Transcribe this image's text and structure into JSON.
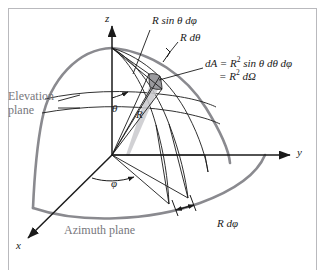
{
  "figure": {
    "type": "diagram",
    "background_color": "#ffffff",
    "frame_color": "#b9b9bd",
    "ink_color": "#1a1a1a",
    "accent_gray": "#77777c",
    "sphere_outline_color": "#8a8a8f",
    "patch_fill_color": "#9a9a9e",
    "wedge_fill_color": "#c9c9cd"
  },
  "axes": {
    "z": {
      "label": "z",
      "x": 105,
      "y": 12
    },
    "y": {
      "label": "y",
      "x": 297,
      "y": 152
    },
    "x": {
      "label": "x",
      "x": 16,
      "y": 245
    }
  },
  "angles": {
    "theta": {
      "label": "θ",
      "x": 114,
      "y": 107
    },
    "phi": {
      "label": "φ",
      "x": 112,
      "y": 182
    }
  },
  "radius": {
    "label": "R",
    "x": 137,
    "y": 114
  },
  "annotations": {
    "arc_sin": {
      "label": "R sin θ dφ",
      "x": 152,
      "y": 20
    },
    "arc_theta": {
      "label": "R dθ",
      "x": 180,
      "y": 37
    },
    "area_line1_prefix": "dA = R",
    "area_line1_exp": "2",
    "area_line1_suffix": " sin θ dθ dφ",
    "area_line2_prefix": "= R",
    "area_line2_exp": "2",
    "area_line2_suffix": " dΩ",
    "area_x": 205,
    "area_y": 62,
    "arc_phi": {
      "label": "R dφ",
      "x": 217,
      "y": 223
    }
  },
  "planes": {
    "elevation": {
      "line1": "Elevation",
      "line2": "plane",
      "x": 8,
      "y": 96
    },
    "azimuth": {
      "label": "Azimuth plane",
      "x": 64,
      "y": 230
    }
  }
}
